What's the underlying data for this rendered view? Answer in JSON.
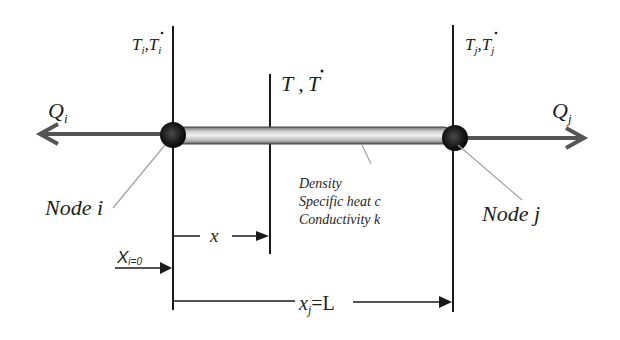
{
  "diagram": {
    "node_i": {
      "label": "Node i",
      "top_label_T": "T",
      "top_label_sub": "i",
      "top_label_sep": ",",
      "heat_flow": "Q",
      "heat_flow_sub": "i"
    },
    "node_j": {
      "label": "Node j",
      "top_label_T": "T",
      "top_label_sub": "j",
      "top_label_sep": ",",
      "heat_flow": "Q",
      "heat_flow_sub": "j"
    },
    "interior": {
      "label_T": "T",
      "label_sep": " ,",
      "label_Tdot": "T"
    },
    "properties": [
      "Density",
      "Specific heat c",
      "Conductivity k"
    ],
    "dimensions": {
      "x_label": "x",
      "xi_label": "X",
      "xi_sub": "i=0",
      "xj_label": "x",
      "xj_sub": "j",
      "xj_eq": "=L"
    },
    "colors": {
      "line": "#1a1a1a",
      "arrow": "#555555",
      "rod_light": "#e6e6e6",
      "rod_dark": "#8a8a8a",
      "node": "#1a1a1a",
      "leader": "#a0a0a0"
    }
  }
}
